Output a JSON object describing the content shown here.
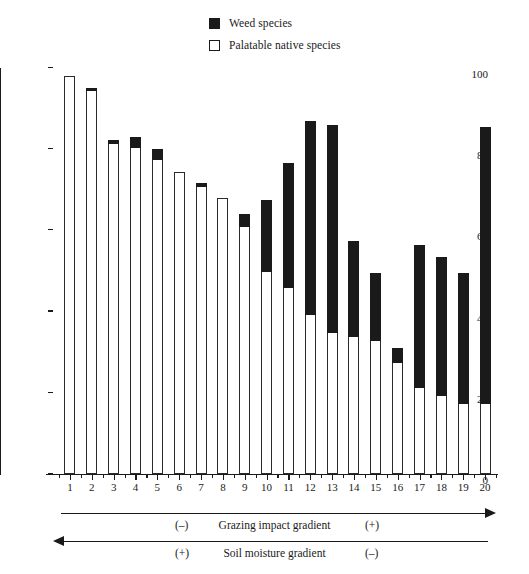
{
  "legend": {
    "items": [
      {
        "label": "Weed species",
        "swatch": "weed-swatch",
        "color": "#1a1a1a"
      },
      {
        "label": "Palatable native species",
        "swatch": "native-swatch",
        "color": "#ffffff"
      }
    ]
  },
  "axes": {
    "y_label": "Cover %",
    "y_ticks": [
      "0",
      "20",
      "40",
      "60",
      "80",
      "100"
    ],
    "x_ticks": [
      "1",
      "2",
      "3",
      "4",
      "5",
      "6",
      "7",
      "8",
      "9",
      "10",
      "11",
      "12",
      "13",
      "14",
      "15",
      "16",
      "17",
      "18",
      "19",
      "20"
    ]
  },
  "annotations": {
    "grazing": {
      "text": "Grazing impact gradient",
      "left_sign": "(–)",
      "right_sign": "(+)",
      "direction": "right"
    },
    "moisture": {
      "text": "Soil moisture gradient",
      "left_sign": "(+)",
      "right_sign": "(–)",
      "direction": "left"
    }
  },
  "chart_data": {
    "type": "bar",
    "stacked": true,
    "title": "",
    "xlabel": "",
    "ylabel": "Cover %",
    "ylim": [
      0,
      100
    ],
    "grid": false,
    "legend_position": "top-center",
    "categories": [
      "1",
      "2",
      "3",
      "4",
      "5",
      "6",
      "7",
      "8",
      "9",
      "10",
      "11",
      "12",
      "13",
      "14",
      "15",
      "16",
      "17",
      "18",
      "19",
      "20"
    ],
    "series": [
      {
        "name": "Palatable native species",
        "color": "#ffffff",
        "values": [
          98,
          94.5,
          81.5,
          80.5,
          77.5,
          74.5,
          71,
          68,
          61,
          50,
          46,
          39.5,
          35,
          34,
          33,
          27.5,
          21.5,
          19.5,
          17.5,
          17.5
        ]
      },
      {
        "name": "Weed species",
        "color": "#1a1a1a",
        "values": [
          0,
          0.7,
          0.7,
          2.5,
          2.5,
          0,
          0.7,
          0,
          3,
          17.5,
          30.5,
          47.5,
          51,
          23.5,
          16.5,
          3.5,
          35,
          34,
          32,
          68
        ]
      }
    ],
    "totals": [
      98,
      95.2,
      82.2,
      83,
      80,
      74.5,
      71.7,
      68,
      64,
      67.5,
      76.5,
      87,
      86,
      57.5,
      49.5,
      31,
      56.5,
      53.5,
      49.5,
      85.5
    ]
  }
}
